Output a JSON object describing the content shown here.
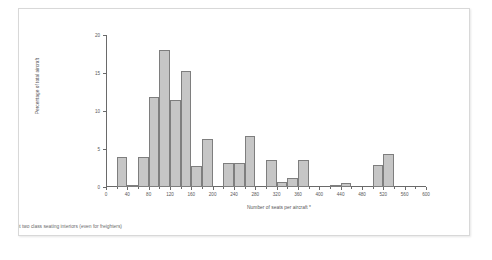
{
  "figure": {
    "background_color": "#ffffff",
    "frame_color": "#d8d8d8",
    "footnote": "quivalent two class seating interiors (even for freighters)"
  },
  "chart_data": {
    "type": "bar",
    "title": "",
    "subtitle": "",
    "xlabel": "Number of seats per aircraft *",
    "ylabel": "Percentage of total aircraft",
    "xlim": [
      0,
      600
    ],
    "ylim": [
      0,
      20
    ],
    "bin_width": 20,
    "grid": false,
    "legend": null,
    "bar_color": "#c6c6c6",
    "bar_edge_color": "#7e7e7e",
    "x_ticks": [
      0,
      40,
      80,
      120,
      160,
      200,
      240,
      280,
      320,
      360,
      400,
      440,
      480,
      520,
      560,
      600
    ],
    "x_minor_tick_step": 20,
    "y_ticks": [
      0,
      5,
      10,
      15,
      20
    ],
    "bins": [
      {
        "start": 20,
        "end": 40,
        "value": 4.0
      },
      {
        "start": 40,
        "end": 60,
        "value": 0.2
      },
      {
        "start": 60,
        "end": 80,
        "value": 4.0
      },
      {
        "start": 80,
        "end": 100,
        "value": 11.8
      },
      {
        "start": 100,
        "end": 120,
        "value": 18.0
      },
      {
        "start": 120,
        "end": 140,
        "value": 11.5
      },
      {
        "start": 140,
        "end": 160,
        "value": 15.3
      },
      {
        "start": 160,
        "end": 180,
        "value": 2.8
      },
      {
        "start": 180,
        "end": 200,
        "value": 6.3
      },
      {
        "start": 220,
        "end": 240,
        "value": 3.2
      },
      {
        "start": 240,
        "end": 260,
        "value": 3.2
      },
      {
        "start": 260,
        "end": 280,
        "value": 6.7
      },
      {
        "start": 300,
        "end": 320,
        "value": 3.5
      },
      {
        "start": 320,
        "end": 340,
        "value": 0.7
      },
      {
        "start": 340,
        "end": 360,
        "value": 1.2
      },
      {
        "start": 360,
        "end": 380,
        "value": 3.5
      },
      {
        "start": 420,
        "end": 440,
        "value": 0.3
      },
      {
        "start": 440,
        "end": 460,
        "value": 0.5
      },
      {
        "start": 500,
        "end": 520,
        "value": 2.9
      },
      {
        "start": 520,
        "end": 540,
        "value": 4.3
      }
    ]
  }
}
